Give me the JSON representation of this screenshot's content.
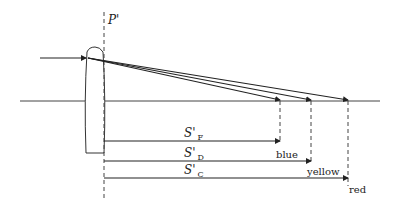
{
  "diagram": {
    "principal_plane_label": "P'",
    "distances": [
      {
        "symbol": "S'",
        "subscript": "F",
        "color_label": "blue"
      },
      {
        "symbol": "S'",
        "subscript": "D",
        "color_label": "yellow"
      },
      {
        "symbol": "S'",
        "subscript": "C",
        "color_label": "red"
      }
    ],
    "colors": {
      "line": "#222222",
      "background": "#ffffff"
    }
  }
}
